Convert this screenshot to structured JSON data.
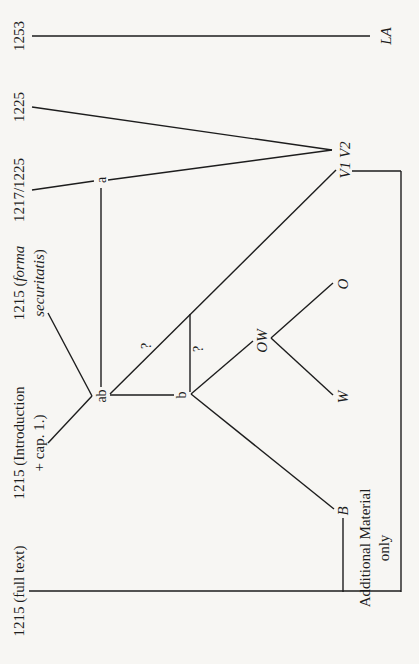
{
  "diagram": {
    "type": "stemma",
    "orientation": "rotated-90-ccw",
    "date_labels": {
      "d1253": "1253",
      "d1225": "1225",
      "d1217": "1217/1225",
      "forma_a": "1215 (",
      "forma_b": "forma",
      "forma_c": "securitatis",
      "forma_d": ")",
      "intro_a": "1215 (Introduction",
      "intro_b": "+ cap. 1.)",
      "full": "1215 (full text)"
    },
    "nodes": {
      "a": "a",
      "ab": "ab",
      "b": "b",
      "q1": "?",
      "q2": "?",
      "LA": "LA",
      "V1V2": "V1 V2",
      "OW": "OW",
      "O": "O",
      "W": "W",
      "B": "B"
    },
    "notes": {
      "additional_1": "Additional Material",
      "additional_2": "only"
    },
    "colors": {
      "line": "#1d1d1d",
      "background": "#f7f6f3"
    }
  }
}
